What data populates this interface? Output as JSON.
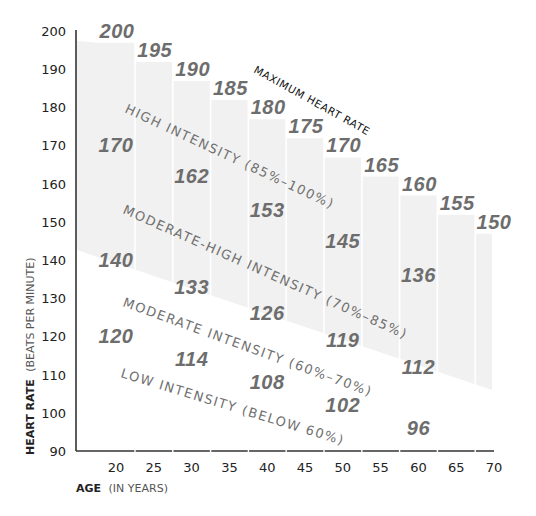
{
  "chart_data": {
    "type": "line",
    "title": "",
    "xlabel": "AGE (IN YEARS)",
    "xlabel_bold": "AGE",
    "xlabel_light": "(IN YEARS)",
    "ylabel": "HEART RATE (BEATS PER MINUTE)",
    "ylabel_bold": "HEART RATE",
    "ylabel_light": "(BEATS PER MINUTE)",
    "xlim": [
      15,
      70
    ],
    "ylim": [
      90,
      200
    ],
    "x_ticks": [
      20,
      25,
      30,
      35,
      40,
      45,
      50,
      55,
      60,
      65,
      70
    ],
    "y_ticks": [
      200,
      190,
      180,
      170,
      160,
      150,
      140,
      130,
      120,
      110,
      100,
      90
    ],
    "grid": "vertical white lines within shaded band",
    "series": [
      {
        "name": "Maximum Heart Rate",
        "label": "MAXIMUM HEART RATE",
        "x": [
          20,
          25,
          30,
          35,
          40,
          45,
          50,
          55,
          60,
          65,
          70
        ],
        "values": [
          200,
          195,
          190,
          185,
          180,
          175,
          170,
          165,
          160,
          155,
          150
        ]
      },
      {
        "name": "85% of Max",
        "x": [
          20,
          30,
          40,
          50,
          60
        ],
        "values": [
          170,
          162,
          153,
          145,
          136
        ]
      },
      {
        "name": "70% of Max",
        "x": [
          20,
          30,
          40,
          50,
          60
        ],
        "values": [
          140,
          133,
          126,
          119,
          112
        ]
      },
      {
        "name": "60% of Max",
        "x": [
          20,
          30,
          40,
          50,
          60
        ],
        "values": [
          120,
          114,
          108,
          102,
          96
        ]
      }
    ],
    "zones": [
      {
        "label": "HIGH INTENSITY (85%–100%)"
      },
      {
        "label": "MODERATE-HIGH INTENSITY (70%–85%)"
      },
      {
        "label": "MODERATE INTENSITY (60%–70%)"
      },
      {
        "label": "LOW INTENSITY (BELOW 60%)"
      }
    ],
    "colors": {
      "band": "#f1f1f1",
      "value_text": "#6d6d6d",
      "axis": "#333333"
    }
  }
}
